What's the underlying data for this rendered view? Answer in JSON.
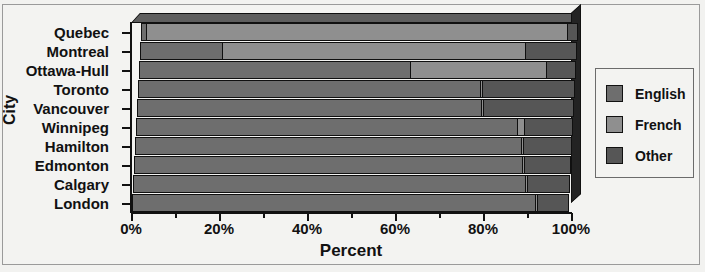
{
  "chart_data": {
    "type": "bar",
    "orientation": "horizontal",
    "stacked": true,
    "percent_stacked": true,
    "title": "",
    "xlabel": "Percent",
    "ylabel": "City",
    "xlim": [
      0,
      100
    ],
    "xticks": [
      "0%",
      "20%",
      "40%",
      "60%",
      "80%",
      "100%"
    ],
    "xtick_values": [
      0,
      20,
      40,
      60,
      80,
      100
    ],
    "minor_tick_values": [
      10,
      30,
      50,
      70,
      90
    ],
    "grid": false,
    "legend_position": "right",
    "categories": [
      "Quebec",
      "Montreal",
      "Ottawa-Hull",
      "Toronto",
      "Vancouver",
      "Winnipeg",
      "Hamilton",
      "Edmonton",
      "Calgary",
      "London"
    ],
    "series": [
      {
        "name": "English",
        "color": "#6e6e6e",
        "values": [
          1.5,
          19.0,
          62.0,
          78.0,
          78.5,
          87.0,
          88.0,
          88.5,
          89.5,
          92.0
        ]
      },
      {
        "name": "French",
        "color": "#8f8f8f",
        "values": [
          96.0,
          69.0,
          31.0,
          0.8,
          0.6,
          1.8,
          0.7,
          0.7,
          0.6,
          0.6
        ]
      },
      {
        "name": "Other",
        "color": "#565656",
        "values": [
          2.5,
          12.0,
          7.0,
          21.2,
          20.9,
          11.2,
          11.3,
          10.8,
          9.9,
          7.4
        ]
      }
    ]
  },
  "legend": {
    "items": [
      {
        "label": "English",
        "color": "#6e6e6e"
      },
      {
        "label": "French",
        "color": "#8f8f8f"
      },
      {
        "label": "Other",
        "color": "#565656"
      }
    ]
  },
  "axes": {
    "x_title": "Percent",
    "y_title": "City"
  }
}
